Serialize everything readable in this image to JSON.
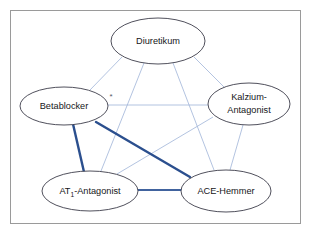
{
  "figure": {
    "frame_color": "#9a9a9a",
    "background_color": "#ffffff"
  },
  "nodes": [
    {
      "id": "diuretikum",
      "label": "Diuretikum",
      "label_line2": "",
      "cx": 158,
      "cy": 41,
      "rx": 47,
      "ry": 23
    },
    {
      "id": "betablocker",
      "label": "Betablocker",
      "label_line2": "",
      "cx": 64,
      "cy": 106,
      "rx": 44,
      "ry": 19
    },
    {
      "id": "kalzium-antagonist",
      "label": "Kalzium-",
      "label_line2": "Antagonist",
      "cx": 249,
      "cy": 104,
      "rx": 41,
      "ry": 21
    },
    {
      "id": "at1-antagonist",
      "label": "AT",
      "label_sub": "1",
      "label_rest": "-Antagonist",
      "label_line2": "",
      "cx": 90,
      "cy": 191,
      "rx": 48,
      "ry": 20
    },
    {
      "id": "ace-hemmer",
      "label": "ACE-Hemmer",
      "label_line2": "",
      "cx": 226,
      "cy": 191,
      "rx": 45,
      "ry": 21
    }
  ],
  "edges": [
    {
      "id": "diuretikum-betablocker",
      "from": "diuretikum",
      "to": "betablocker",
      "strength": "weak",
      "x1": 122,
      "y1": 57,
      "x2": 90,
      "y2": 90
    },
    {
      "id": "diuretikum-kalzium",
      "from": "diuretikum",
      "to": "kalzium-antagonist",
      "strength": "weak",
      "x1": 194,
      "y1": 57,
      "x2": 225,
      "y2": 88
    },
    {
      "id": "diuretikum-at1",
      "from": "diuretikum",
      "to": "at1-antagonist",
      "strength": "weak",
      "x1": 144,
      "y1": 63,
      "x2": 101,
      "y2": 171
    },
    {
      "id": "diuretikum-ace",
      "from": "diuretikum",
      "to": "ace-hemmer",
      "strength": "weak",
      "x1": 173,
      "y1": 63,
      "x2": 214,
      "y2": 170
    },
    {
      "id": "betablocker-kalzium",
      "from": "betablocker",
      "to": "kalzium-antagonist",
      "strength": "weak",
      "x1": 108,
      "y1": 105,
      "x2": 208,
      "y2": 105
    },
    {
      "id": "betablocker-at1",
      "from": "betablocker",
      "to": "at1-antagonist",
      "strength": "strong",
      "x1": 73,
      "y1": 124,
      "x2": 84,
      "y2": 172
    },
    {
      "id": "betablocker-ace",
      "from": "betablocker",
      "to": "ace-hemmer",
      "strength": "strong",
      "x1": 96,
      "y1": 122,
      "x2": 190,
      "y2": 177
    },
    {
      "id": "kalzium-at1",
      "from": "kalzium-antagonist",
      "to": "at1-antagonist",
      "strength": "weak",
      "x1": 213,
      "y1": 117,
      "x2": 117,
      "y2": 174
    },
    {
      "id": "kalzium-ace",
      "from": "kalzium-antagonist",
      "to": "ace-hemmer",
      "strength": "weak",
      "x1": 243,
      "y1": 125,
      "x2": 230,
      "y2": 170
    },
    {
      "id": "at1-ace",
      "from": "at1-antagonist",
      "to": "ace-hemmer",
      "strength": "medium",
      "x1": 138,
      "y1": 190,
      "x2": 182,
      "y2": 190
    }
  ],
  "annotations": [
    {
      "id": "footnote-asterisk",
      "text": "*",
      "x": 111,
      "y": 96
    }
  ],
  "colors": {
    "weak_edge": "#9fb4d8",
    "strong_edge": "#2b4f8e",
    "medium_edge": "#41639e",
    "node_stroke": "#3c3c4a",
    "node_fill": "#ffffff",
    "text": "#161620"
  }
}
